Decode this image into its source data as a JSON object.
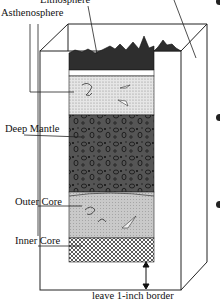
{
  "diagram": {
    "labels": {
      "lithosphere": "Lithosphere",
      "asthenosphere": "Asthenosphere",
      "deep_mantle": "Deep Mantle",
      "outer_core": "Outer Core",
      "inner_core": "Inner Core",
      "border_note": "leave 1-inch border"
    },
    "layers": [
      {
        "name": "Lithosphere",
        "pattern": "dark jagged mountains",
        "color": "#2a2a2a"
      },
      {
        "name": "Asthenosphere",
        "pattern": "light stipple with swirls",
        "color": "#d8d8d8"
      },
      {
        "name": "Deep Mantle",
        "pattern": "dark with oval pebbles",
        "color": "#4a4a4a"
      },
      {
        "name": "Outer Core",
        "pattern": "light gray with swirls",
        "color": "#c8c8c8"
      },
      {
        "name": "Inner Core",
        "pattern": "crosshatch",
        "color": "#9a9a9a"
      }
    ],
    "bullets": 3
  }
}
